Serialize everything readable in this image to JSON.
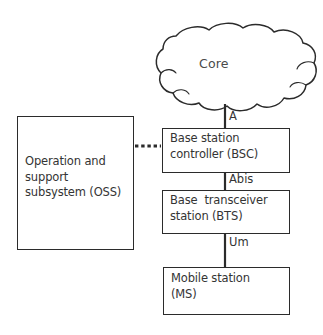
{
  "diagram": {
    "background_color": "#ffffff",
    "stroke_color": "#2b2b2b",
    "text_color": "#343434",
    "cloud": {
      "name": "core-network-cloud",
      "label": "Core"
    },
    "nodes": [
      {
        "id": "oss",
        "label": "Operation and\nsupport\nsubsystem (OSS)",
        "shape": "rectangle"
      },
      {
        "id": "bsc",
        "label": "Base station\ncontroller (BSC)",
        "shape": "rectangle"
      },
      {
        "id": "bts",
        "label": "Base  transceiver\nstation (BTS)",
        "shape": "rectangle"
      },
      {
        "id": "ms",
        "label": "Mobile station\n(MS)",
        "shape": "rectangle"
      }
    ],
    "connectors": [
      {
        "id": "core-bsc",
        "from": "core",
        "to": "bsc",
        "style": "solid",
        "interface_label": "A"
      },
      {
        "id": "bsc-bts",
        "from": "bsc",
        "to": "bts",
        "style": "solid",
        "interface_label": "Abis"
      },
      {
        "id": "bts-ms",
        "from": "bts",
        "to": "ms",
        "style": "solid",
        "interface_label": "Um"
      },
      {
        "id": "oss-bsc",
        "from": "oss",
        "to": "bsc",
        "style": "dotted",
        "interface_label": ""
      }
    ],
    "interface_labels": {
      "a": "A",
      "abis": "Abis",
      "um": "Um"
    }
  }
}
